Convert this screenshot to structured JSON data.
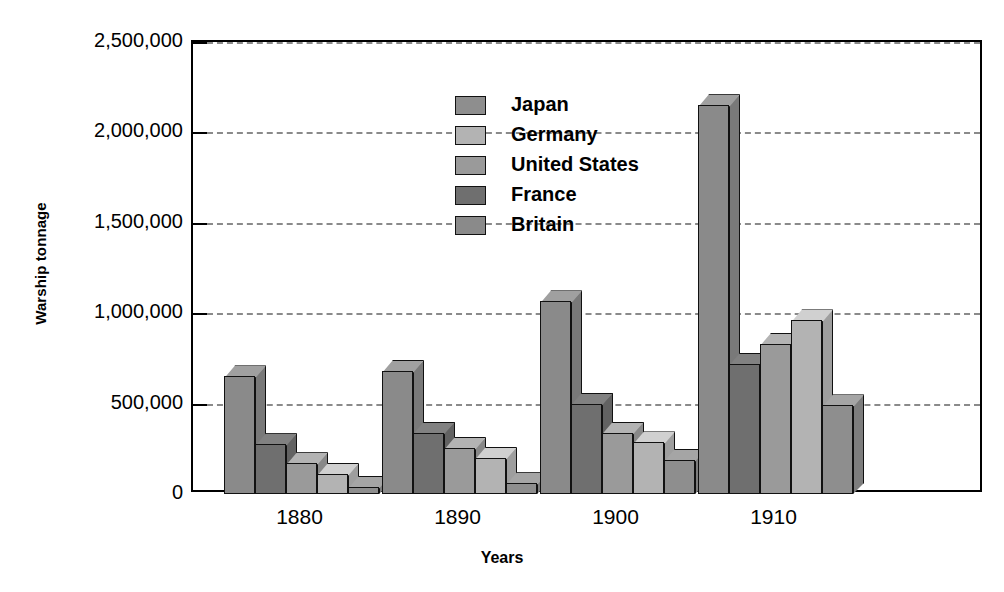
{
  "chart_data": {
    "type": "bar",
    "title": "",
    "xlabel": "Years",
    "ylabel": "Warship tonnage",
    "categories": [
      "1880",
      "1890",
      "1900",
      "1910"
    ],
    "ylim": [
      0,
      2500000
    ],
    "yticks": [
      0,
      500000,
      1000000,
      1500000,
      2000000,
      2500000
    ],
    "ytick_labels": [
      "0",
      "500,000",
      "1,000,000",
      "1,500,000",
      "2,000,000",
      "2,500,000"
    ],
    "grid": "horizontal-dashed",
    "legend_position": "upper-left-inside",
    "series_draw_order": [
      "Britain",
      "France",
      "United States",
      "Germany",
      "Japan"
    ],
    "series": [
      {
        "name": "Japan",
        "color": "#8e8e8e",
        "values": [
          40000,
          60000,
          190000,
          490000
        ]
      },
      {
        "name": "Germany",
        "color": "#b3b3b3",
        "values": [
          110000,
          200000,
          285000,
          960000
        ]
      },
      {
        "name": "United States",
        "color": "#9a9a9a",
        "values": [
          170000,
          255000,
          340000,
          830000
        ]
      },
      {
        "name": "France",
        "color": "#6f6f6f",
        "values": [
          275000,
          340000,
          500000,
          720000
        ]
      },
      {
        "name": "Britain",
        "color": "#8a8a8a",
        "values": [
          650000,
          680000,
          1065000,
          2150000
        ]
      }
    ]
  },
  "legend": {
    "items": [
      {
        "label": "Japan",
        "color": "#8e8e8e"
      },
      {
        "label": "Germany",
        "color": "#b3b3b3"
      },
      {
        "label": "United States",
        "color": "#9a9a9a"
      },
      {
        "label": "France",
        "color": "#6f6f6f"
      },
      {
        "label": "Britain",
        "color": "#8a8a8a"
      }
    ]
  },
  "colors": {
    "axis": "#000000",
    "gridline": "#8a8a8a",
    "background": "#ffffff",
    "bar_outline": "#111111"
  }
}
